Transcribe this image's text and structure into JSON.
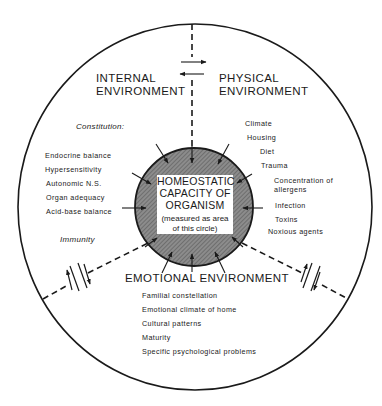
{
  "diagram": {
    "center": {
      "title_lines": [
        "HOMEOSTATIC",
        "CAPACITY OF",
        "ORGANISM"
      ],
      "note_lines": [
        "(measured as area",
        "of this circle)"
      ]
    },
    "internal": {
      "heading_lines": [
        "INTERNAL",
        "ENVIRONMENT"
      ],
      "constitution_label": "Constitution:",
      "items": [
        "Endocrine balance",
        "Hypersensitivity",
        "Autonomic N.S.",
        "Organ adequacy",
        "Acid-base balance"
      ],
      "immunity_label": "Immunity"
    },
    "physical": {
      "heading_lines": [
        "PHYSICAL",
        "ENVIRONMENT"
      ],
      "items": [
        "Climate",
        "Housing",
        "Diet",
        "Trauma",
        "Concentration of",
        "allergens",
        "Infection",
        "Toxins",
        "Noxious agents"
      ]
    },
    "emotional": {
      "heading": "EMOTIONAL  ENVIRONMENT",
      "items": [
        "Familial constellation",
        "Emotional climate of home",
        "Cultural patterns",
        "Maturity",
        "Specific psychological problems"
      ]
    }
  }
}
